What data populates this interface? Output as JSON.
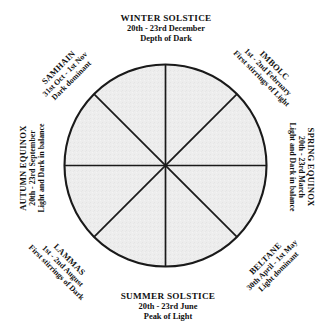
{
  "diagram": {
    "type": "eight-spoke seasonal wheel",
    "colors": {
      "background": "#ffffff",
      "sector_fill": "#ededed",
      "stroke": "#1a1a1a",
      "text": "#111111"
    },
    "geometry": {
      "center_x": 165,
      "center_y": 166,
      "radius": 103,
      "sectors": 8,
      "spoke_angles_deg": [
        0,
        45,
        90,
        135,
        180,
        225,
        270,
        315
      ]
    },
    "stations": [
      {
        "id": "winter-solstice",
        "name": "WINTER SOLSTICE",
        "dates": "20th - 23rd December",
        "meaning": "Depth of Dark",
        "position": "top",
        "rotation_deg": 0
      },
      {
        "id": "imbolc",
        "name": "IMBOLC",
        "dates": "1st - 2nd February",
        "meaning": "First stirrings of Light",
        "position": "top-right",
        "rotation_deg": 45
      },
      {
        "id": "spring-equinox",
        "name": "SPRING EQUINOX",
        "dates": "20th - 23rd March",
        "meaning": "Light and Dark in balance",
        "position": "right",
        "rotation_deg": 90
      },
      {
        "id": "beltane",
        "name": "BELTANE",
        "dates": "30th April - 1st May",
        "meaning": "Light dominant",
        "position": "bottom-right",
        "rotation_deg": -45
      },
      {
        "id": "summer-solstice",
        "name": "SUMMER SOLSTICE",
        "dates": "20th - 23rd June",
        "meaning": "Peak of Light",
        "position": "bottom",
        "rotation_deg": 0
      },
      {
        "id": "lammas",
        "name": "LAMMAS",
        "dates": "1st - 2nd August",
        "meaning": "First stirrings of Dark",
        "position": "bottom-left",
        "rotation_deg": 45
      },
      {
        "id": "autumn-equinox",
        "name": "AUTUMN EQUINOX",
        "dates": "20th - 23rd September",
        "meaning": "Light and Dark in balance",
        "position": "left",
        "rotation_deg": -90
      },
      {
        "id": "samhain",
        "name": "SAMHAIN",
        "dates": "31st Oct - 1st Nov",
        "meaning": "Dark dominant",
        "position": "top-left",
        "rotation_deg": -45
      }
    ]
  }
}
